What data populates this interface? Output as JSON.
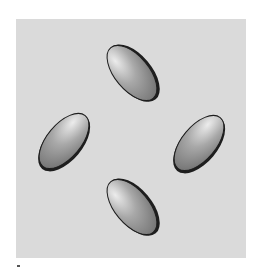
{
  "figure": {
    "background_color": "#dadada",
    "ellipse_fill_light": "#ececec",
    "ellipse_fill_mid": "#a8a8a8",
    "ellipse_fill_dark": "#6e6e6e",
    "ellipse_stroke": "#1e1e1e",
    "ellipses": [
      {
        "id": "top",
        "cx": 132,
        "cy": 73,
        "rx": 17,
        "ry": 33,
        "rotate": -40
      },
      {
        "id": "left",
        "cx": 64,
        "cy": 141,
        "rx": 17,
        "ry": 33,
        "rotate": 40
      },
      {
        "id": "right",
        "cx": 199,
        "cy": 143,
        "rx": 17,
        "ry": 33,
        "rotate": 40
      },
      {
        "id": "bottom",
        "cx": 132,
        "cy": 207,
        "rx": 17,
        "ry": 33,
        "rotate": -40
      }
    ]
  }
}
